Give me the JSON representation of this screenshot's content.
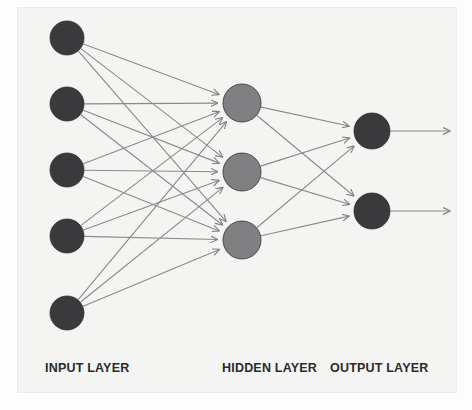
{
  "figure": {
    "background_color": "#fdfdfd",
    "panel_color": "#f4f4f2",
    "width": 472,
    "height": 410
  },
  "labels": {
    "input": "INPUT LAYER",
    "hidden": "HIDDEN LAYER",
    "output": "OUTPUT LAYER",
    "color": "#2b2b2b"
  },
  "chart_data": {
    "type": "diagram",
    "layers": [
      {
        "id": "input",
        "label": "INPUT LAYER",
        "node_count": 5,
        "node_color": "#3a3a3c",
        "node_radius": 17,
        "x": 67,
        "node_y": [
          38,
          104,
          170,
          236,
          313
        ]
      },
      {
        "id": "hidden",
        "label": "HIDDEN LAYER",
        "node_count": 3,
        "node_color": "#808083",
        "node_radius": 19,
        "x": 242,
        "node_y": [
          103,
          172,
          240
        ]
      },
      {
        "id": "output",
        "label": "OUTPUT LAYER",
        "node_count": 2,
        "node_color": "#3a3a3c",
        "node_radius": 18,
        "x": 372,
        "node_y": [
          131,
          211
        ]
      }
    ],
    "connections": {
      "input_to_hidden": "fully-connected",
      "hidden_to_output": "fully-connected",
      "edge_count_input_hidden": 15,
      "edge_count_hidden_output": 6,
      "output_arrows": 2,
      "edge_color": "#8a8a8a",
      "edge_width": 1.1,
      "arrowheads": true,
      "direction": "left-to-right"
    },
    "output_arrow_end_x": 450
  }
}
